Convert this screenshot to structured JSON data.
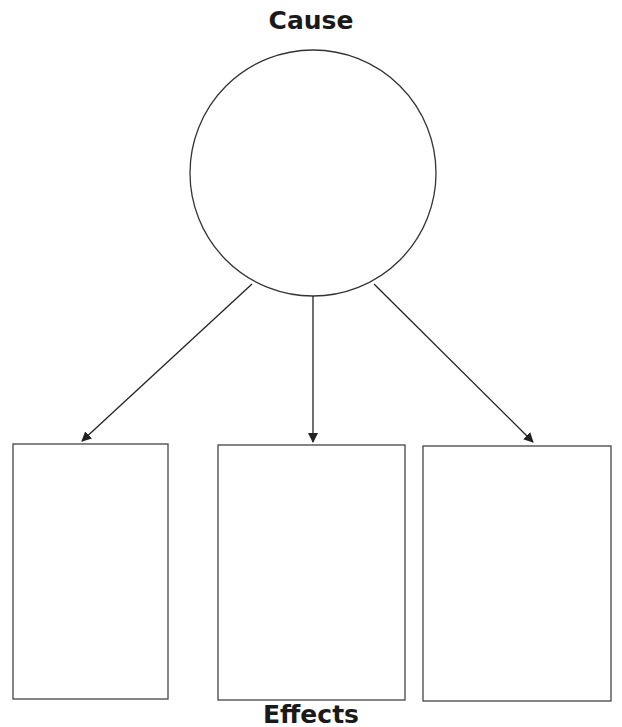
{
  "diagram": {
    "type": "cause-and-effect organizer",
    "cause": {
      "title": "Cause",
      "content": ""
    },
    "effects_title": "Effects",
    "effects": [
      {
        "content": ""
      },
      {
        "content": ""
      },
      {
        "content": ""
      }
    ],
    "colors": {
      "stroke": "#333333",
      "background": "#ffffff"
    }
  }
}
